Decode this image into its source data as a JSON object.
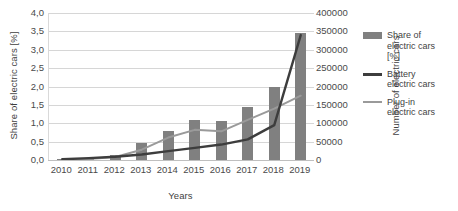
{
  "chart_data": {
    "type": "bar",
    "title": "",
    "subtitle": "",
    "xlabel": "Years",
    "ylabel": "Share of electric cars [%]",
    "ylabel_secondary": "Number of electric cars",
    "categories": [
      "2010",
      "2011",
      "2012",
      "2013",
      "2014",
      "2015",
      "2016",
      "2017",
      "2018",
      "2019"
    ],
    "ylim": [
      0,
      4.0
    ],
    "ylim_secondary": [
      0,
      400000
    ],
    "ytick_labels": [
      "4,0",
      "3,5",
      "3,0",
      "2,5",
      "2,0",
      "1,5",
      "1,0",
      "0,5",
      "0,0"
    ],
    "ytick_values": [
      4.0,
      3.5,
      3.0,
      2.5,
      2.0,
      1.5,
      1.0,
      0.5,
      0.0
    ],
    "ytick_labels_secondary": [
      "400000",
      "350000",
      "300000",
      "250000",
      "200000",
      "150000",
      "100000",
      "50000",
      "0"
    ],
    "ytick_values_secondary": [
      400000,
      350000,
      300000,
      250000,
      200000,
      150000,
      100000,
      50000,
      0
    ],
    "grid": true,
    "legend_position": "right",
    "series": [
      {
        "name": "Share of electric cars [%]",
        "type": "bar",
        "axis": "left",
        "color": "#808080",
        "values": [
          0.02,
          0.05,
          0.15,
          0.45,
          0.8,
          1.1,
          1.05,
          1.45,
          2.0,
          3.45
        ]
      },
      {
        "name": "Battery electric cars",
        "type": "line",
        "axis": "right",
        "color": "#3d3d3d",
        "values": [
          2000,
          5000,
          9000,
          15000,
          24000,
          33000,
          42000,
          56000,
          95000,
          340000
        ]
      },
      {
        "name": "Plug-in electric cars",
        "type": "line",
        "axis": "right",
        "color": "#9a9a9a",
        "values": [
          1000,
          3000,
          8000,
          28000,
          61000,
          82000,
          78000,
          109000,
          140000,
          175000
        ]
      }
    ]
  },
  "legend": {
    "items": [
      {
        "label_lines": [
          "Share of",
          "electric cars",
          "[%]"
        ],
        "marker": "bar-swatch"
      },
      {
        "label_lines": [
          "Battery",
          "electric cars"
        ],
        "marker": "line-swatch-dark"
      },
      {
        "label_lines": [
          "Plug-in",
          "electric cars"
        ],
        "marker": "line-swatch-light"
      }
    ]
  }
}
